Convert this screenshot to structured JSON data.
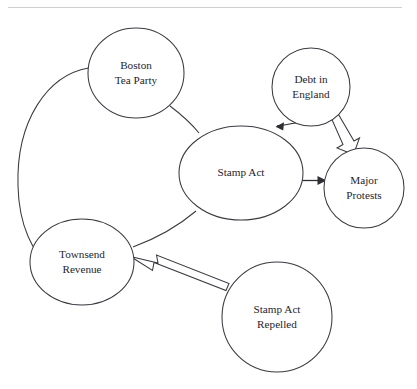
{
  "diagram": {
    "background_color": "#ffffff",
    "stroke_color": "#3a3a42",
    "text_color": "#25252b",
    "rule_color": "#cfcfcf",
    "top_rule": {
      "x1": 8,
      "x2": 402,
      "y": 7
    },
    "nodes": [
      {
        "id": "boston-tea-party",
        "label_lines": [
          "Boston",
          "Tea Party"
        ],
        "line1": "Boston",
        "line2": "Tea Party",
        "shape": "circle",
        "cx": 136,
        "cy": 73,
        "rx": 48,
        "ry": 45
      },
      {
        "id": "debt-in-england",
        "label_lines": [
          "Debt in",
          "England"
        ],
        "line1": "Debt in",
        "line2": "England",
        "shape": "circle",
        "cx": 311,
        "cy": 87,
        "rx": 39,
        "ry": 39
      },
      {
        "id": "stamp-act",
        "label_lines": [
          "Stamp Act"
        ],
        "line1": "Stamp Act",
        "line2": "",
        "shape": "ellipse",
        "cx": 241,
        "cy": 173,
        "rx": 62,
        "ry": 47
      },
      {
        "id": "major-protests",
        "label_lines": [
          "Major",
          "Protests"
        ],
        "line1": "Major",
        "line2": "Protests",
        "shape": "circle",
        "cx": 364,
        "cy": 188,
        "rx": 40,
        "ry": 40
      },
      {
        "id": "townsend-revenue",
        "label_lines": [
          "Townsend",
          "Revenue"
        ],
        "line1": "Townsend",
        "line2": "Revenue",
        "shape": "circle",
        "cx": 82,
        "cy": 262,
        "rx": 52,
        "ry": 43
      },
      {
        "id": "stamp-act-repelled",
        "label_lines": [
          "Stamp Act",
          "Repelled"
        ],
        "line1": "Stamp Act",
        "line2": "Repelled",
        "shape": "circle",
        "cx": 277,
        "cy": 317,
        "rx": 55,
        "ry": 55
      }
    ],
    "edges": [
      {
        "id": "boston-tea-party-to-townsend-revenue",
        "from": "boston-tea-party",
        "to": "townsend-revenue",
        "style": "plain-curve",
        "arrow": "none"
      },
      {
        "id": "boston-tea-party-to-stamp-act",
        "from": "boston-tea-party",
        "to": "stamp-act",
        "style": "plain-curve",
        "arrow": "none"
      },
      {
        "id": "stamp-act-to-townsend-revenue",
        "from": "stamp-act",
        "to": "townsend-revenue",
        "style": "plain-curve",
        "arrow": "none"
      },
      {
        "id": "debt-in-england-to-stamp-act",
        "from": "debt-in-england",
        "to": "stamp-act",
        "style": "curve",
        "arrow": "filled-head"
      },
      {
        "id": "debt-in-england-to-major-protests",
        "from": "debt-in-england",
        "to": "major-protests",
        "style": "block-arrow",
        "arrow": "hollow-head"
      },
      {
        "id": "stamp-act-to-major-protests",
        "from": "stamp-act",
        "to": "major-protests",
        "style": "straight",
        "arrow": "filled-head"
      },
      {
        "id": "stamp-act-repelled-to-townsend-revenue",
        "from": "stamp-act-repelled",
        "to": "townsend-revenue",
        "style": "block-arrow",
        "arrow": "hollow-head"
      }
    ]
  }
}
